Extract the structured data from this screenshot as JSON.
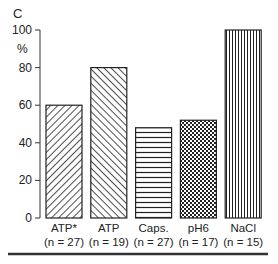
{
  "chart_data": {
    "type": "bar",
    "panel_label": "C",
    "title": "",
    "xlabel": "",
    "ylabel": "%",
    "ylim": [
      0,
      100
    ],
    "yticks": [
      0,
      20,
      40,
      60,
      80,
      100
    ],
    "grid": false,
    "legend": "none",
    "categories": [
      "ATP*",
      "ATP",
      "Caps.",
      "pH6",
      "NaCl"
    ],
    "sample_sizes": [
      "(n = 27)",
      "(n = 19)",
      "(n = 27)",
      "(n = 17)",
      "(n = 15)"
    ],
    "values": [
      60,
      80,
      48,
      52,
      100
    ],
    "patterns": [
      "diagonal-back",
      "diagonal-forward",
      "horizontal",
      "checker",
      "vertical"
    ]
  }
}
